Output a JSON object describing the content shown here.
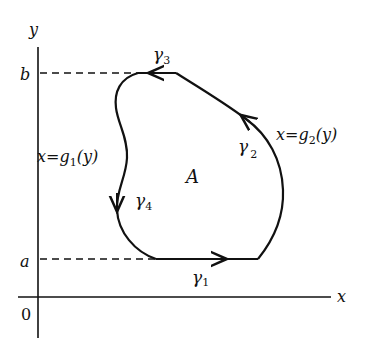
{
  "diagram": {
    "axes": {
      "x_label": "x",
      "y_label": "y",
      "origin_label": "0"
    },
    "levels": {
      "b_label": "b",
      "a_label": "a"
    },
    "region_label": "A",
    "curves": [
      {
        "id": "gamma1",
        "symbol": "γ",
        "subscript": "1",
        "direction": "right"
      },
      {
        "id": "gamma2",
        "symbol": "γ",
        "subscript": "2",
        "direction": "up"
      },
      {
        "id": "gamma3",
        "symbol": "γ",
        "subscript": "3",
        "direction": "left"
      },
      {
        "id": "gamma4",
        "symbol": "γ",
        "subscript": "4",
        "direction": "down"
      }
    ],
    "equations": {
      "left": {
        "lhs": "x=g",
        "sub": "1",
        "rhs": "(y)"
      },
      "right": {
        "lhs": "x=g",
        "sub": "2",
        "rhs": "(y)"
      }
    },
    "colors": {
      "ink": "#111111",
      "background": "#ffffff"
    }
  }
}
